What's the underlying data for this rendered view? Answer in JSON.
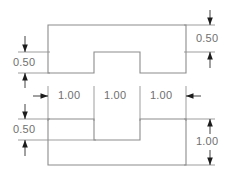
{
  "drawing": {
    "title": "Sectional profile dimensioned drawing",
    "units_note": "",
    "line_color": "#8c8c8c",
    "dimension_color": "#2e2e2e",
    "text_color": "#6f6f6f",
    "background_color": "#ffffff",
    "views": [
      {
        "id": "top-view",
        "name": "inverted-t-profile",
        "dimensions": [
          {
            "id": "top-left-vertical",
            "value": "0.50",
            "orientation": "vertical",
            "position": "left"
          },
          {
            "id": "top-right-vertical",
            "value": "0.50",
            "orientation": "vertical",
            "position": "right"
          }
        ]
      },
      {
        "id": "bottom-view",
        "name": "u-channel-profile",
        "dimensions": [
          {
            "id": "bottom-horizontal-1",
            "value": "1.00",
            "orientation": "horizontal",
            "position": "top"
          },
          {
            "id": "bottom-horizontal-2",
            "value": "1.00",
            "orientation": "horizontal",
            "position": "top"
          },
          {
            "id": "bottom-horizontal-3",
            "value": "1.00",
            "orientation": "horizontal",
            "position": "top"
          },
          {
            "id": "bottom-left-vertical",
            "value": "0.50",
            "orientation": "vertical",
            "position": "left"
          },
          {
            "id": "bottom-right-vertical",
            "value": "1.00",
            "orientation": "vertical",
            "position": "right"
          }
        ]
      }
    ],
    "labels": {
      "top_left_050": "0.50",
      "top_right_050": "0.50",
      "span_1_100": "1.00",
      "span_2_100": "1.00",
      "span_3_100": "1.00",
      "bottom_left_050": "0.50",
      "bottom_right_100": "1.00"
    }
  }
}
